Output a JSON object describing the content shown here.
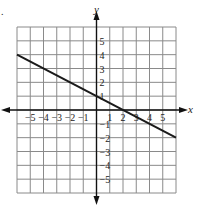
{
  "chart_data": {
    "type": "line",
    "title": "",
    "problem_marker": ".",
    "xlabel": "x",
    "ylabel": "y",
    "xlim": [
      -6,
      6
    ],
    "ylim": [
      -6,
      6
    ],
    "grid": true,
    "x_tick_labels": [
      "-5",
      "-4",
      "-3",
      "-2",
      "-1",
      "1",
      "2",
      "3",
      "4",
      "5"
    ],
    "y_tick_labels": [
      "5",
      "4",
      "3",
      "2",
      "1",
      "-1",
      "-2",
      "-3",
      "-4",
      "-5"
    ],
    "series": [
      {
        "name": "line",
        "x": [
          -6,
          6
        ],
        "y": [
          4,
          -2
        ],
        "slope": -0.5,
        "y_intercept": 1,
        "x_intercept": 2,
        "color": "#1a1a1a"
      }
    ]
  }
}
